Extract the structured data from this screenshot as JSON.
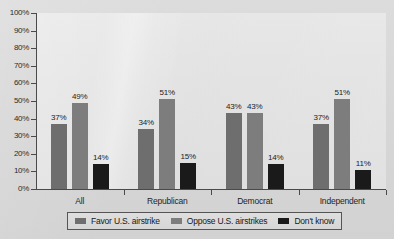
{
  "chart_data": {
    "type": "bar",
    "title": "",
    "subtitle": "",
    "xlabel": "",
    "ylabel": "",
    "categories": [
      "All",
      "Republican",
      "Democrat",
      "Independent"
    ],
    "series": [
      {
        "name": "Favor U.S. airstrike",
        "color": "#6e6e6e",
        "values": [
          37,
          49,
          43,
          43
        ],
        "labels": [
          "37%",
          "49%",
          "43%",
          "43%"
        ]
      },
      {
        "name": "Oppose U.S. airstrikes",
        "color": "#7d7d7d",
        "values": [
          49,
          51,
          43,
          51
        ],
        "labels": [
          "49%",
          "51%",
          "43%",
          "51%"
        ]
      },
      {
        "name": "Don't know",
        "color": "#1a1a1a",
        "values": [
          14,
          15,
          14,
          11
        ],
        "labels": [
          "14%",
          "15%",
          "14%",
          "11%"
        ]
      }
    ],
    "grouped_values": [
      {
        "category": "All",
        "Favor U.S. airstrike": 37,
        "Oppose U.S. airstrikes": 49,
        "Don't know": 14
      },
      {
        "category": "Republican",
        "Favor U.S. airstrike": 34,
        "Oppose U.S. airstrikes": 51,
        "Don't know": 15
      },
      {
        "category": "Democrat",
        "Favor U.S. airstrike": 43,
        "Oppose U.S. airstrikes": 43,
        "Don't know": 14
      },
      {
        "category": "Independent",
        "Favor U.S. airstrike": 37,
        "Oppose U.S. airstrikes": 51,
        "Don't know": 11
      }
    ],
    "bars": [
      {
        "group": "All",
        "series": "Favor U.S. airstrike",
        "value": 37,
        "label": "37%"
      },
      {
        "group": "All",
        "series": "Oppose U.S. airstrikes",
        "value": 49,
        "label": "49%"
      },
      {
        "group": "All",
        "series": "Don't know",
        "value": 14,
        "label": "14%"
      },
      {
        "group": "Republican",
        "series": "Favor U.S. airstrike",
        "value": 34,
        "label": "34%"
      },
      {
        "group": "Republican",
        "series": "Oppose U.S. airstrikes",
        "value": 51,
        "label": "51%"
      },
      {
        "group": "Republican",
        "series": "Don't know",
        "value": 15,
        "label": "15%"
      },
      {
        "group": "Democrat",
        "series": "Favor U.S. airstrike",
        "value": 43,
        "label": "43%"
      },
      {
        "group": "Democrat",
        "series": "Oppose U.S. airstrikes",
        "value": 43,
        "label": "43%"
      },
      {
        "group": "Democrat",
        "series": "Don't know",
        "value": 14,
        "label": "14%"
      },
      {
        "group": "Independent",
        "series": "Favor U.S. airstrike",
        "value": 37,
        "label": "37%"
      },
      {
        "group": "Independent",
        "series": "Oppose U.S. airstrikes",
        "value": 51,
        "label": "51%"
      },
      {
        "group": "Independent",
        "series": "Don't know",
        "value": 11,
        "label": "11%"
      }
    ],
    "ylim": [
      0,
      100
    ],
    "y_ticks": [
      0,
      10,
      20,
      30,
      40,
      50,
      60,
      70,
      80,
      90,
      100
    ],
    "y_tick_labels": [
      "0%",
      "10%",
      "20%",
      "30%",
      "40%",
      "50%",
      "60%",
      "70%",
      "80%",
      "90%",
      "100%"
    ],
    "grid": false,
    "legend_position": "bottom"
  },
  "legend": {
    "items": [
      {
        "label": "Favor U.S. airstrike",
        "color": "#6e6e6e"
      },
      {
        "label": "Oppose U.S. airstrikes",
        "color": "#7d7d7d"
      },
      {
        "label": "Don't know",
        "color": "#1a1a1a"
      }
    ]
  },
  "colors": {
    "background": "#d9d9d9",
    "plot_background": "#e2e2e2",
    "axis": "#4a4a4a",
    "text": "#1c1c1c",
    "series_favor": "#6e6e6e",
    "series_oppose": "#7d7d7d",
    "series_dontknow": "#1a1a1a"
  }
}
